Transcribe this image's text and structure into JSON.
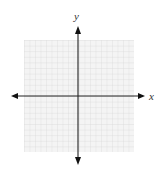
{
  "diagram": {
    "type": "coordinate-grid",
    "x_axis_label": "x",
    "y_axis_label": "y",
    "grid_cells": 20,
    "colors": {
      "grid_line": "#d9d9d9",
      "grid_bg": "#f3f3f3",
      "axis": "#222222"
    }
  }
}
